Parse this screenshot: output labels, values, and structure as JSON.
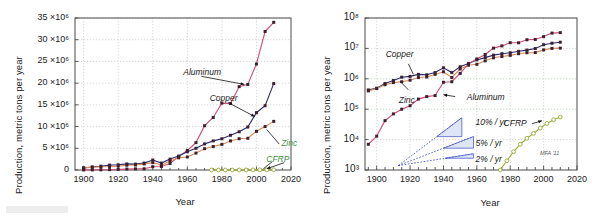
{
  "figure": {
    "credit": "MFA '11",
    "colors": {
      "aluminum": "#d14d72",
      "copper": "#2b2b6b",
      "zinc": "#d98a5a",
      "cfrp": "#9aa832",
      "growth": "#3b4cc0",
      "growth_fill": "#c3d0ee",
      "frame": "#4a4a4a",
      "grid": "#bdbdbd",
      "zinc_label": "#3f8f3f",
      "cfrp_label": "#3f8f3f"
    }
  },
  "chart_data": [
    {
      "id": "linear-panel",
      "type": "line",
      "title": "",
      "xlabel": "Year",
      "ylabel": "Production, metric tons per year",
      "xlim": [
        1895,
        2020
      ],
      "ylim": [
        0,
        35000000
      ],
      "yscale": "linear",
      "grid": true,
      "legend_position": "inline-annotations",
      "xticks": [
        1900,
        1920,
        1940,
        1960,
        1980,
        2000,
        2020
      ],
      "xticklabels": [
        "1900",
        "1920",
        "1940",
        "1960",
        "1980",
        "2000",
        "2020"
      ],
      "yticks": [
        0,
        5000000,
        10000000,
        15000000,
        20000000,
        25000000,
        30000000,
        35000000
      ],
      "yticklabels": [
        "0",
        "5 ×10⁶",
        "10 ×10⁶",
        "15 ×10⁶",
        "20 ×10⁶",
        "25 ×10⁶",
        "30 ×10⁶",
        "35 ×10⁶"
      ],
      "annotations": [
        {
          "text": "Aluminum",
          "x": 1975,
          "y": 22500000
        },
        {
          "text": "Copper",
          "x": 1988,
          "y": 16500000
        },
        {
          "text": "Zinc",
          "x": 2012,
          "y": 6200000
        },
        {
          "text": "CFRP",
          "x": 2008,
          "y": 2600000
        }
      ],
      "series": [
        {
          "name": "Aluminum",
          "color": "#d14d72",
          "marker": "square",
          "x": [
            1900,
            1905,
            1910,
            1915,
            1920,
            1925,
            1930,
            1935,
            1940,
            1945,
            1950,
            1955,
            1960,
            1965,
            1970,
            1975,
            1980,
            1985,
            1990,
            1995,
            2000,
            2005,
            2010
          ],
          "y": [
            7000,
            20000,
            45000,
            75000,
            130000,
            215000,
            260000,
            280000,
            770000,
            800000,
            1500000,
            3100000,
            4500000,
            6300000,
            10200000,
            12100000,
            15400000,
            15300000,
            19200000,
            19700000,
            24400000,
            31900000,
            34000000
          ]
        },
        {
          "name": "Copper",
          "color": "#2b2b6b",
          "marker": "square",
          "x": [
            1900,
            1905,
            1910,
            1915,
            1920,
            1925,
            1930,
            1935,
            1940,
            1945,
            1950,
            1955,
            1960,
            1965,
            1970,
            1975,
            1980,
            1985,
            1990,
            1995,
            2000,
            2005,
            2010
          ],
          "y": [
            490000,
            700000,
            880000,
            1130000,
            1200000,
            1400000,
            1350000,
            1600000,
            2300000,
            1600000,
            2500000,
            3200000,
            4200000,
            5000000,
            6000000,
            6700000,
            7200000,
            8000000,
            8800000,
            9900000,
            13200000,
            14800000,
            19900000
          ]
        },
        {
          "name": "Zinc",
          "color": "#d98a5a",
          "marker": "square",
          "x": [
            1900,
            1905,
            1910,
            1915,
            1920,
            1925,
            1930,
            1935,
            1940,
            1945,
            1950,
            1955,
            1960,
            1965,
            1970,
            1975,
            1980,
            1985,
            1990,
            1995,
            2000,
            2005,
            2010
          ],
          "y": [
            480000,
            640000,
            750000,
            800000,
            900000,
            1100000,
            1150000,
            1400000,
            1700000,
            1100000,
            2100000,
            2800000,
            3000000,
            3900000,
            4900000,
            5400000,
            5900000,
            6700000,
            7200000,
            7300000,
            8900000,
            10000000,
            11200000
          ]
        },
        {
          "name": "CFRP",
          "color": "#9aa832",
          "marker": "circle-open",
          "x": [
            1974,
            1978,
            1982,
            1986,
            1990,
            1994,
            1998,
            2002,
            2006,
            2010
          ],
          "y": [
            1000,
            2000,
            4000,
            7000,
            11000,
            16000,
            24000,
            34000,
            45000,
            55000
          ]
        }
      ]
    },
    {
      "id": "log-panel",
      "type": "line",
      "title": "",
      "xlabel": "Year",
      "ylabel": "Production, metric tons per year",
      "xlim": [
        1893,
        2020
      ],
      "ylim": [
        1000,
        100000000
      ],
      "yscale": "log",
      "grid": true,
      "legend_position": "inline-annotations",
      "xticks": [
        1900,
        1920,
        1940,
        1960,
        1980,
        2000,
        2020
      ],
      "xticklabels": [
        "1900",
        "1920",
        "1940",
        "1960",
        "1980",
        "2000",
        "2020"
      ],
      "xminorticks_every": 5,
      "yticks": [
        1000,
        10000,
        100000,
        1000000,
        10000000,
        100000000
      ],
      "yticklabels": [
        "10³",
        "10⁴",
        "10⁵",
        "10⁶",
        "10⁷",
        "10⁸"
      ],
      "annotations": [
        {
          "text": "Copper",
          "x": 1915,
          "y": 4200000
        },
        {
          "text": "Zinc",
          "x": 1918,
          "y": 330000
        },
        {
          "text": "Aluminum",
          "x": 1948,
          "y": 260000
        },
        {
          "text": "CFRP",
          "x": 1988,
          "y": 33000
        },
        {
          "text": "10% / yr",
          "x": 1958,
          "y": 36000
        },
        {
          "text": "5% / yr",
          "x": 1958,
          "y": 7300
        },
        {
          "text": "2% / yr",
          "x": 1958,
          "y": 2100
        }
      ],
      "growth_guides": [
        {
          "label": "10% / yr",
          "rate_percent": 10
        },
        {
          "label": "5% / yr",
          "rate_percent": 5
        },
        {
          "label": "2% / yr",
          "rate_percent": 2
        }
      ],
      "series": [
        {
          "name": "Copper",
          "color": "#2b2b6b",
          "marker": "square",
          "x": [
            1895,
            1900,
            1905,
            1910,
            1915,
            1920,
            1925,
            1930,
            1935,
            1940,
            1945,
            1950,
            1955,
            1960,
            1965,
            1970,
            1975,
            1980,
            1985,
            1990,
            1995,
            2000,
            2005,
            2010
          ],
          "y": [
            430000,
            490000,
            700000,
            880000,
            1130000,
            1200000,
            1400000,
            1350000,
            1600000,
            2300000,
            1600000,
            2500000,
            3200000,
            4200000,
            5000000,
            6000000,
            6700000,
            7200000,
            8000000,
            8800000,
            9900000,
            13200000,
            14800000,
            16000000
          ]
        },
        {
          "name": "Zinc",
          "color": "#d98a5a",
          "marker": "square",
          "x": [
            1895,
            1900,
            1905,
            1910,
            1915,
            1920,
            1925,
            1930,
            1935,
            1940,
            1945,
            1950,
            1955,
            1960,
            1965,
            1970,
            1975,
            1980,
            1985,
            1990,
            1995,
            2000,
            2005,
            2010
          ],
          "y": [
            400000,
            480000,
            640000,
            750000,
            800000,
            900000,
            1100000,
            1150000,
            1400000,
            1700000,
            1100000,
            2100000,
            2800000,
            3000000,
            3900000,
            4900000,
            5400000,
            5900000,
            6700000,
            7200000,
            7300000,
            8900000,
            10000000,
            10200000
          ]
        },
        {
          "name": "Aluminum",
          "color": "#d14d72",
          "marker": "square",
          "x": [
            1895,
            1900,
            1905,
            1910,
            1915,
            1920,
            1925,
            1930,
            1935,
            1940,
            1945,
            1950,
            1955,
            1960,
            1965,
            1970,
            1975,
            1980,
            1985,
            1990,
            1995,
            2000,
            2005,
            2010
          ],
          "y": [
            7000,
            13000,
            42000,
            70000,
            100000,
            130000,
            215000,
            260000,
            280000,
            770000,
            800000,
            1500000,
            3100000,
            4500000,
            6300000,
            10200000,
            12100000,
            15400000,
            15300000,
            19200000,
            19700000,
            24400000,
            31900000,
            33000000
          ]
        },
        {
          "name": "CFRP",
          "color": "#9aa832",
          "marker": "circle-open",
          "x": [
            1974,
            1978,
            1982,
            1986,
            1990,
            1994,
            1998,
            2002,
            2006,
            2010
          ],
          "y": [
            1000,
            2000,
            4000,
            7000,
            11000,
            16000,
            24000,
            34000,
            45000,
            55000
          ]
        }
      ]
    }
  ]
}
